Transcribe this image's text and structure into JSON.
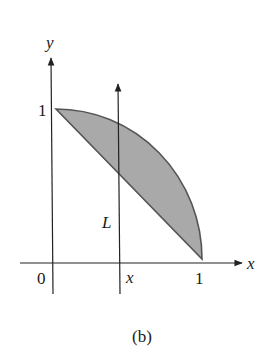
{
  "figure": {
    "caption": "(b)",
    "axes": {
      "x_label": "x",
      "y_label": "y",
      "origin_label": "0",
      "x_tick_label": "1",
      "y_tick_label": "1"
    },
    "vertical_line": {
      "label": "L",
      "position_label": "x"
    },
    "region": {
      "description": "Shaded region between line y = 1 - x and quarter circle y = sqrt(1 - x^2) for 0 ≤ x ≤ 1",
      "fill_color": "#a9a9a9",
      "stroke_color": "#555555"
    },
    "colors": {
      "axis": "#222222",
      "text": "#1a1a1a",
      "background": "#ffffff"
    }
  }
}
